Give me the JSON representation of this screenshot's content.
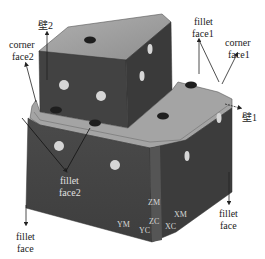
{
  "diagram": {
    "colors": {
      "top_face": "#9c9c9c",
      "left_face": "#454545",
      "right_face": "#3a3a3a",
      "hole_dark": "#1e1e1e",
      "hole_light": "#d6d6d6",
      "arrow": "#222222",
      "label": "#222222",
      "axis_label": "#d8d8d8"
    },
    "labels": {
      "wall2": "壁2",
      "corner_face2_line1": "corner",
      "corner_face2_line2": "face2",
      "fillet_face1_line1": "fillet",
      "fillet_face1_line2": "face1",
      "corner_face1_line1": "corner",
      "corner_face1_line2": "face1",
      "wall1": "壁1",
      "fillet_face2_line1": "fillet",
      "fillet_face2_line2": "face2",
      "fillet_face_left_line1": "fillet",
      "fillet_face_left_line2": "face",
      "fillet_face_right_line1": "fillet",
      "fillet_face_right_line2": "face"
    },
    "axes": {
      "zm": "ZM",
      "ym": "YM",
      "zc": "ZC",
      "yc": "YC",
      "xm": "XM",
      "xc": "XC"
    }
  }
}
